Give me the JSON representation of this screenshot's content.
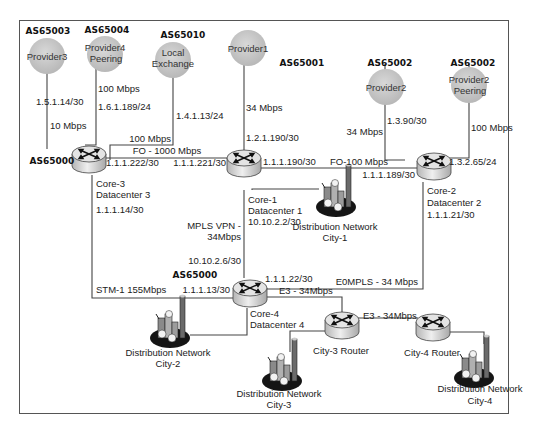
{
  "frame": {
    "border_color": "#555555",
    "background": "#ffffff"
  },
  "colors": {
    "provider_fill": "#c9c9c9",
    "router_top": "#e6e6e6",
    "router_side": "#cfcfcf",
    "line": "#444444"
  },
  "providers": [
    {
      "id": "provider3",
      "label_lines": [
        "Provider3"
      ],
      "as": "AS65003"
    },
    {
      "id": "provider4",
      "label_lines": [
        "Provider4",
        "Peering"
      ],
      "as": "AS65004"
    },
    {
      "id": "local_exchange",
      "label_lines": [
        "Local",
        "Exchange"
      ],
      "as": "AS65010"
    },
    {
      "id": "provider1",
      "label_lines": [
        "Provider1"
      ],
      "as": "AS65001"
    },
    {
      "id": "provider2",
      "label_lines": [
        "Provider2"
      ],
      "as": "AS65002"
    },
    {
      "id": "provider2_peering",
      "label_lines": [
        "Provider2",
        "Peering"
      ],
      "as": "AS65002"
    }
  ],
  "routers": [
    {
      "id": "core3",
      "name": "Core-3",
      "site": "Datacenter 3",
      "as": "AS65000"
    },
    {
      "id": "core1",
      "name": "Core-1",
      "site": "Datacenter 1",
      "ip": "10.10.2.2/30"
    },
    {
      "id": "core2",
      "name": "Core-2",
      "site": "Datacenter 2",
      "ip": "1.1.1.21/30"
    },
    {
      "id": "core4",
      "name": "Core-4",
      "site": "Datacenter 4",
      "as": "AS65000"
    },
    {
      "id": "city3",
      "name": "City-3 Router"
    },
    {
      "id": "city4",
      "name": "City-4 Router"
    }
  ],
  "distribution": [
    {
      "id": "dn1",
      "lines": [
        "Distribution Network",
        "City-1"
      ]
    },
    {
      "id": "dn2",
      "lines": [
        "Distribution Network",
        "City-2"
      ]
    },
    {
      "id": "dn3",
      "lines": [
        "Distribution Network",
        "City-3"
      ]
    },
    {
      "id": "dn4",
      "lines": [
        "Distribution Network",
        "City-4"
      ]
    }
  ],
  "links": {
    "p3": {
      "ip": "1.5.1.14/30",
      "bw": "10 Mbps"
    },
    "p4": {
      "bw": "100 Mbps",
      "ip": "1.6.1.189/24"
    },
    "lx": {
      "ip": "1.4.1.13/24",
      "bw": "100 Mbps"
    },
    "p1": {
      "bw": "34 Mbps",
      "ip": "1.2.1.190/30"
    },
    "p2": {
      "ip": "1.3.90/30",
      "bw": "34 Mbps"
    },
    "p2peer": {
      "bw": "100 Mbps",
      "ip": "1.3.2.65/24"
    },
    "core3_core1": {
      "bw": "FO - 1000 Mbps",
      "ip_a": "1.1.1.222/30",
      "ip_b": "1.1.1.221/30"
    },
    "core1_core2": {
      "bw": "FO-100 Mbps",
      "ip_a": "1.1.1.190/30",
      "ip_b": "1.1.1.189/30"
    },
    "core3_core4": {
      "ip_a": "1.1.1.14/30",
      "bw": "STM-1 155Mbps",
      "ip_b": "1.1.1.13/30"
    },
    "core1_core4": {
      "bw_line1": "MPLS VPN -",
      "bw_line2": "34Mbps",
      "ip": "10.10.2.6/30"
    },
    "core2_core4": {
      "ip": "1.1.1.22/30",
      "bw": "E0MPLS - 34 Mbps"
    },
    "core4_city3": {
      "bw": "E3 - 34Mbps"
    },
    "city3_city4": {
      "bw": "E3 - 34Mbps"
    }
  }
}
